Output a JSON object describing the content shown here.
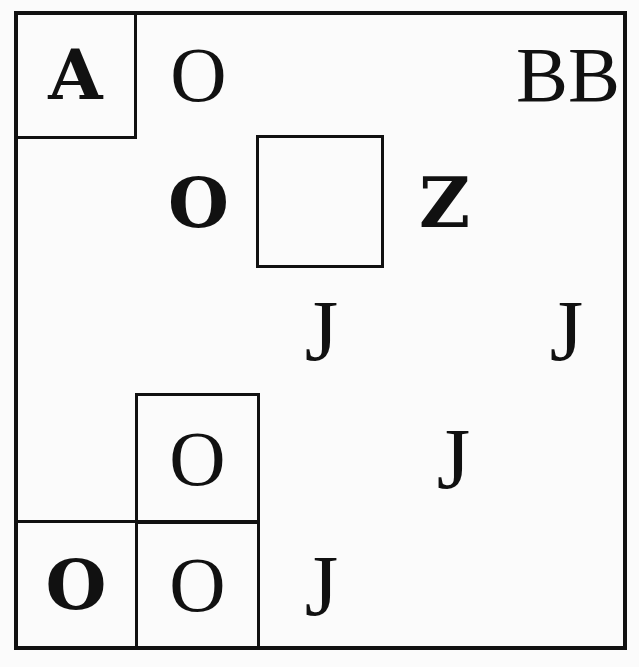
{
  "puzzle": {
    "grid_size": 5,
    "cells": [
      {
        "row": 0,
        "col": 0,
        "text": "A",
        "bold": true,
        "boxed": true
      },
      {
        "row": 0,
        "col": 1,
        "text": "O",
        "bold": false,
        "boxed": false
      },
      {
        "row": 0,
        "col": 4,
        "text": "BB",
        "bold": false,
        "boxed": false
      },
      {
        "row": 1,
        "col": 1,
        "text": "O",
        "bold": true,
        "boxed": false
      },
      {
        "row": 1,
        "col": 2,
        "text": "",
        "bold": false,
        "boxed": true
      },
      {
        "row": 1,
        "col": 3,
        "text": "Z",
        "bold": true,
        "boxed": false
      },
      {
        "row": 2,
        "col": 2,
        "text": "J",
        "bold": false,
        "boxed": false
      },
      {
        "row": 2,
        "col": 4,
        "text": "J",
        "bold": false,
        "boxed": false
      },
      {
        "row": 3,
        "col": 1,
        "text": "O",
        "bold": false,
        "boxed": true
      },
      {
        "row": 3,
        "col": 3,
        "text": "J",
        "bold": false,
        "boxed": false
      },
      {
        "row": 4,
        "col": 0,
        "text": "O",
        "bold": true,
        "boxed": true
      },
      {
        "row": 4,
        "col": 1,
        "text": "O",
        "bold": false,
        "boxed": true
      },
      {
        "row": 4,
        "col": 2,
        "text": "J",
        "bold": false,
        "boxed": false
      }
    ]
  }
}
